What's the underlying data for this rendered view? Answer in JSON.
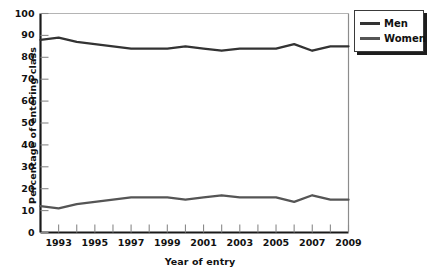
{
  "chart_data": {
    "type": "line",
    "title": "",
    "xlabel": "Year of entry",
    "ylabel": "Percentage of entering class",
    "xlim": [
      1992,
      2009
    ],
    "ylim": [
      0,
      100
    ],
    "grid": false,
    "legend_position": "top-right",
    "x": [
      1992,
      1993,
      1994,
      1995,
      1996,
      1997,
      1998,
      1999,
      2000,
      2001,
      2002,
      2003,
      2004,
      2005,
      2006,
      2007,
      2008,
      2009
    ],
    "x_tick_labels": [
      "1993",
      "1995",
      "1997",
      "1999",
      "2001",
      "2003",
      "2005",
      "2007",
      "2009"
    ],
    "x_tick_values": [
      1993,
      1995,
      1997,
      1999,
      2001,
      2003,
      2005,
      2007,
      2009
    ],
    "y_tick_labels": [
      "0",
      "10",
      "20",
      "30",
      "40",
      "50",
      "60",
      "70",
      "80",
      "90",
      "100"
    ],
    "y_tick_values": [
      0,
      10,
      20,
      30,
      40,
      50,
      60,
      70,
      80,
      90,
      100
    ],
    "series": [
      {
        "name": "Men",
        "color": "#333333",
        "values": [
          88,
          89,
          87,
          86,
          85,
          84,
          84,
          84,
          85,
          84,
          83,
          84,
          84,
          84,
          86,
          83,
          85,
          85
        ]
      },
      {
        "name": "Women",
        "color": "#555555",
        "values": [
          12,
          11,
          13,
          14,
          15,
          16,
          16,
          16,
          15,
          16,
          17,
          16,
          16,
          16,
          14,
          17,
          15,
          15
        ]
      }
    ]
  },
  "legend": {
    "items": [
      {
        "label": "Men",
        "color": "#333333"
      },
      {
        "label": "Women",
        "color": "#555555"
      }
    ]
  }
}
